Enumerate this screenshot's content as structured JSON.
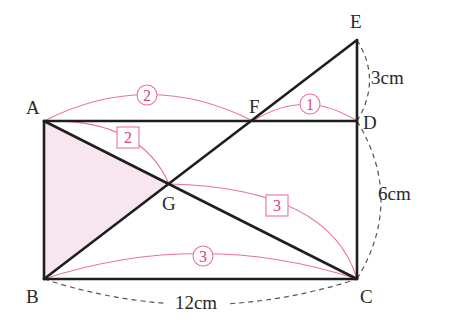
{
  "figure": {
    "type": "geometry-diagram",
    "colors": {
      "edge": "#1e1e1e",
      "ratio": "#d9457a",
      "ratio_arc": "#e8739c",
      "shade": "#f7e6f0",
      "dimension_arc": "#555555"
    }
  },
  "points": {
    "A": {
      "label": "A",
      "x": 44,
      "y": 121
    },
    "B": {
      "label": "B",
      "x": 44,
      "y": 279
    },
    "C": {
      "label": "C",
      "x": 357,
      "y": 279
    },
    "D": {
      "label": "D",
      "x": 357,
      "y": 121
    },
    "E": {
      "label": "E",
      "x": 357,
      "y": 40
    },
    "F": {
      "label": "F",
      "x": 253,
      "y": 121
    },
    "G": {
      "label": "G",
      "x": 169,
      "y": 184
    }
  },
  "dimensions": {
    "ED": "3cm",
    "DC": "6cm",
    "BC": "12cm"
  },
  "ratios": {
    "AF": {
      "value": "2",
      "style": "circled"
    },
    "FD": {
      "value": "1",
      "style": "circled"
    },
    "BC": {
      "value": "3",
      "style": "circled"
    },
    "AG": {
      "value": "2",
      "style": "boxed"
    },
    "GC": {
      "value": "3",
      "style": "boxed"
    }
  },
  "shaded_region": "triangle ABG"
}
